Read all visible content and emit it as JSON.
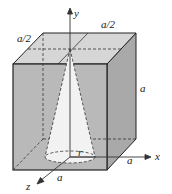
{
  "diagram": {
    "labels": {
      "top_back_edge": "a/2",
      "top_left_edge": "a/2",
      "right_edge": "a",
      "x_edge": "a",
      "z_edge": "a",
      "radius": "r",
      "axis_x": "x",
      "axis_y": "y",
      "axis_z": "z"
    },
    "colors": {
      "front_face": "#b9b9b9",
      "top_face": "#d6d6d6",
      "side_face": "#a9a9a9",
      "cone": "#f2f2f2",
      "edges": "#222222"
    }
  }
}
